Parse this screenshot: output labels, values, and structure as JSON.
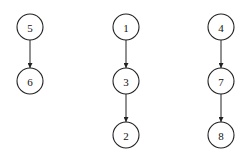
{
  "diagram": {
    "type": "directed-graph",
    "node_radius": 13,
    "nodes": [
      {
        "id": "5",
        "label": "5",
        "x": 30,
        "y": 27
      },
      {
        "id": "6",
        "label": "6",
        "x": 30,
        "y": 81
      },
      {
        "id": "1",
        "label": "1",
        "x": 126,
        "y": 27
      },
      {
        "id": "3",
        "label": "3",
        "x": 126,
        "y": 81
      },
      {
        "id": "2",
        "label": "2",
        "x": 126,
        "y": 135
      },
      {
        "id": "4",
        "label": "4",
        "x": 221,
        "y": 27
      },
      {
        "id": "7",
        "label": "7",
        "x": 221,
        "y": 81
      },
      {
        "id": "8",
        "label": "8",
        "x": 221,
        "y": 135
      }
    ],
    "edges": [
      {
        "from": "5",
        "to": "6"
      },
      {
        "from": "1",
        "to": "3"
      },
      {
        "from": "3",
        "to": "2"
      },
      {
        "from": "4",
        "to": "7"
      },
      {
        "from": "7",
        "to": "8"
      }
    ],
    "colors": {
      "stroke": "#222222",
      "fill": "#ffffff",
      "text": "#111111"
    }
  }
}
